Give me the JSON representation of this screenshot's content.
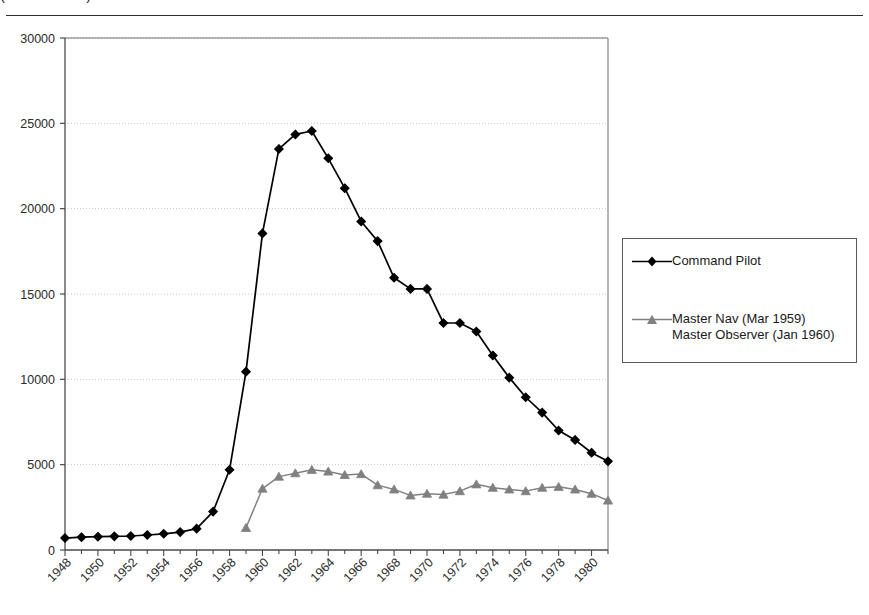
{
  "header": {
    "title_cropped": "(1948 - 1980)",
    "rule": "horizontal-rule"
  },
  "legend": {
    "position": "right",
    "entries": [
      {
        "label": "Command Pilot",
        "color": "#000000",
        "marker": "diamond"
      },
      {
        "label": "Master Nav (Mar 1959)\nMaster Observer (Jan 1960)",
        "color": "#808080",
        "marker": "triangle"
      }
    ]
  },
  "chart_data": {
    "type": "line",
    "title": "(1948 - 1980)",
    "xlabel": "",
    "ylabel": "",
    "xlim": [
      1948,
      1981
    ],
    "ylim": [
      0,
      30000
    ],
    "ytick_step": 5000,
    "yticks": [
      0,
      5000,
      10000,
      15000,
      20000,
      25000,
      30000
    ],
    "ytick_labels": [
      "0",
      "5000",
      "10000",
      "15000",
      "20000",
      "25000",
      "30000"
    ],
    "xticks": [
      1948,
      1950,
      1952,
      1954,
      1956,
      1958,
      1960,
      1962,
      1964,
      1966,
      1968,
      1970,
      1972,
      1974,
      1976,
      1978,
      1980
    ],
    "xtick_labels": [
      "1948",
      "1950",
      "1952",
      "1954",
      "1956",
      "1958",
      "1960",
      "1962",
      "1964",
      "1966",
      "1968",
      "1970",
      "1972",
      "1974",
      "1976",
      "1978",
      "1980"
    ],
    "xtick_rotation": 45,
    "minor_xticks": true,
    "grid": "horizontal-dotted",
    "x": [
      1948,
      1949,
      1950,
      1951,
      1952,
      1953,
      1954,
      1955,
      1956,
      1957,
      1958,
      1959,
      1960,
      1961,
      1962,
      1963,
      1964,
      1965,
      1966,
      1967,
      1968,
      1969,
      1970,
      1971,
      1972,
      1973,
      1974,
      1975,
      1976,
      1977,
      1978,
      1979,
      1980,
      1981
    ],
    "series": [
      {
        "name": "Command Pilot",
        "color": "#000000",
        "marker": "diamond",
        "values": [
          700,
          750,
          780,
          800,
          820,
          880,
          950,
          1050,
          1250,
          2250,
          4700,
          10450,
          18550,
          23500,
          24350,
          24550,
          22950,
          21200,
          19250,
          18100,
          15950,
          15300,
          15300,
          13300,
          13300,
          12800,
          11400,
          10100,
          8950,
          8050,
          7000,
          6450,
          5700,
          5200
        ]
      },
      {
        "name": "Master Nav (Mar 1959) / Master Observer (Jan 1960)",
        "color": "#808080",
        "marker": "triangle",
        "x_start": 1959,
        "values": [
          null,
          null,
          null,
          null,
          null,
          null,
          null,
          null,
          null,
          null,
          null,
          1300,
          3600,
          4300,
          4500,
          4700,
          4600,
          4400,
          4450,
          3800,
          3550,
          3200,
          3300,
          3250,
          3450,
          3850,
          3650,
          3550,
          3450,
          3650,
          3700,
          3550,
          3300,
          2900
        ]
      }
    ]
  }
}
